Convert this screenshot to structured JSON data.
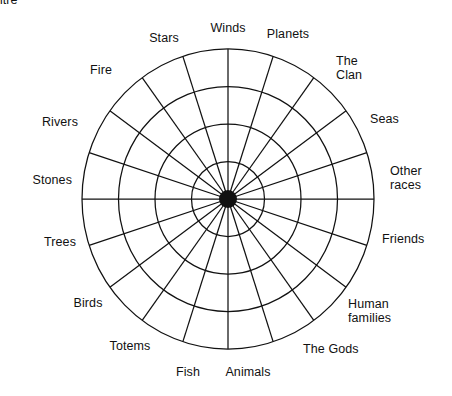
{
  "diagram": {
    "type": "radial-web",
    "centre_label": "centre",
    "ring_count": 4,
    "spoke_count": 20,
    "stroke_color": "#111111",
    "hub_color": "#111111",
    "background_color": "#ffffff",
    "geometry": {
      "center_x": 228,
      "center_y": 199,
      "radius_x": 146,
      "radius_y": 150,
      "hub_radius": 9,
      "ring_fractions": [
        0.25,
        0.5,
        0.75,
        1.0
      ]
    },
    "labels": [
      {
        "text": "Winds",
        "angle_deg": 90,
        "align": "c",
        "x": 228,
        "y": 28
      },
      {
        "text": "Planets",
        "angle_deg": 72,
        "align": "c",
        "x": 288,
        "y": 34
      },
      {
        "text": "The\nClan",
        "angle_deg": 54,
        "align": "l",
        "x": 336,
        "y": 68
      },
      {
        "text": "Seas",
        "angle_deg": 36,
        "align": "l",
        "x": 370,
        "y": 119
      },
      {
        "text": "Other\nraces",
        "angle_deg": 18,
        "align": "l",
        "x": 390,
        "y": 178
      },
      {
        "text": "Friends",
        "angle_deg": 0,
        "align": "l",
        "x": 382,
        "y": 239
      },
      {
        "text": "Human\nfamilies",
        "angle_deg": -27,
        "align": "l",
        "x": 348,
        "y": 311
      },
      {
        "text": "The Gods",
        "angle_deg": -45,
        "align": "l",
        "x": 303,
        "y": 349
      },
      {
        "text": "Animals",
        "angle_deg": -72,
        "align": "c",
        "x": 248,
        "y": 372
      },
      {
        "text": "Fish",
        "angle_deg": -90,
        "align": "c",
        "x": 188,
        "y": 372
      },
      {
        "text": "Totems",
        "angle_deg": -112,
        "align": "c",
        "x": 130,
        "y": 346
      },
      {
        "text": "Birds",
        "angle_deg": -130,
        "align": "c",
        "x": 88,
        "y": 303
      },
      {
        "text": "Trees",
        "angle_deg": -160,
        "align": "r",
        "x": 76,
        "y": 242
      },
      {
        "text": "Stones",
        "angle_deg": 180,
        "align": "r",
        "x": 72,
        "y": 180
      },
      {
        "text": "Rivers",
        "angle_deg": 160,
        "align": "r",
        "x": 78,
        "y": 122
      },
      {
        "text": "Fire",
        "angle_deg": 133,
        "align": "r",
        "x": 112,
        "y": 70
      },
      {
        "text": "Stars",
        "angle_deg": 110,
        "align": "c",
        "x": 164,
        "y": 38
      }
    ]
  }
}
